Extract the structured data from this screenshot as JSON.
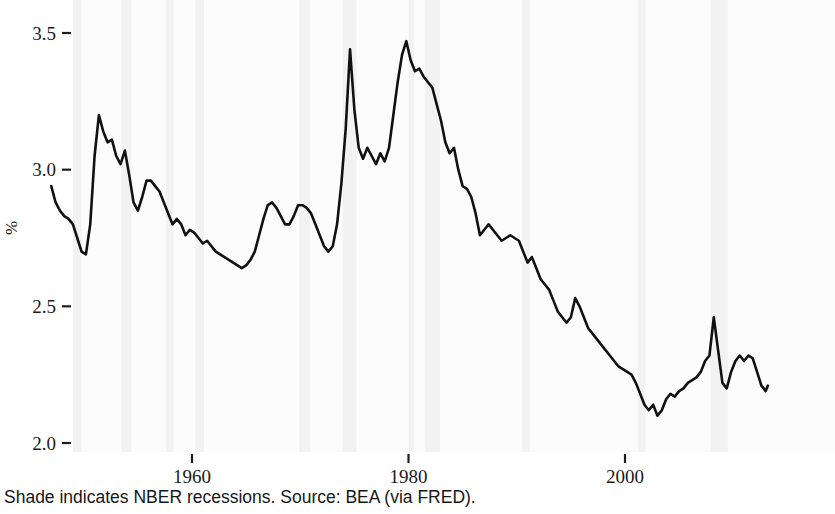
{
  "figure": {
    "caption": "Shade indicates NBER recessions. Source: BEA (via FRED).",
    "background_color": "#ffffff",
    "panel_color": "#fcfcfc",
    "line_color": "#111111",
    "shade_color": "#f2f2f2"
  },
  "axes": {
    "y_title": "%",
    "y_ticks": [
      "2.0",
      "2.5",
      "3.0",
      "3.5"
    ],
    "x_ticks": [
      "1960",
      "1980",
      "2000"
    ]
  },
  "chart_data": {
    "type": "line",
    "title": "",
    "subtitle": "",
    "xlabel": "",
    "ylabel": "%",
    "caption": "Shade indicates NBER recessions. Source: BEA (via FRED).",
    "legend": [],
    "legend_position": "none",
    "grid": false,
    "xlim": [
      1947.0,
      2013.2
    ],
    "ylim": [
      1.96,
      3.56
    ],
    "x_tick_values": [
      1960,
      1980,
      2000
    ],
    "y_tick_values": [
      2.0,
      2.5,
      3.0,
      3.5
    ],
    "x_tick_labels": [
      "1960",
      "1980",
      "2000"
    ],
    "y_tick_labels": [
      "2.0",
      "2.5",
      "3.0",
      "3.5"
    ],
    "series": [
      {
        "name": "Ratio",
        "color": "#111111",
        "x": [
          1947.0,
          1947.4,
          1947.8,
          1948.2,
          1948.6,
          1949.0,
          1949.4,
          1949.8,
          1950.2,
          1950.6,
          1951.0,
          1951.4,
          1951.8,
          1952.2,
          1952.6,
          1953.0,
          1953.4,
          1953.8,
          1954.2,
          1954.6,
          1955.0,
          1955.4,
          1955.8,
          1956.2,
          1956.6,
          1957.0,
          1957.4,
          1957.8,
          1958.2,
          1958.6,
          1959.0,
          1959.4,
          1959.8,
          1960.2,
          1960.6,
          1961.0,
          1961.4,
          1961.8,
          1962.2,
          1962.6,
          1963.0,
          1963.4,
          1963.8,
          1964.2,
          1964.6,
          1965.0,
          1965.4,
          1965.8,
          1966.2,
          1966.6,
          1967.0,
          1967.4,
          1967.8,
          1968.2,
          1968.6,
          1969.0,
          1969.4,
          1969.8,
          1970.2,
          1970.6,
          1971.0,
          1971.4,
          1971.8,
          1972.2,
          1972.6,
          1973.0,
          1973.4,
          1973.8,
          1974.2,
          1974.6,
          1975.0,
          1975.4,
          1975.8,
          1976.2,
          1976.6,
          1977.0,
          1977.4,
          1977.8,
          1978.2,
          1978.6,
          1979.0,
          1979.4,
          1979.8,
          1980.2,
          1980.6,
          1981.0,
          1981.4,
          1981.8,
          1982.2,
          1982.6,
          1983.0,
          1983.4,
          1983.8,
          1984.2,
          1984.6,
          1985.0,
          1985.4,
          1985.8,
          1986.2,
          1986.6,
          1987.0,
          1987.4,
          1987.8,
          1988.2,
          1988.6,
          1989.0,
          1989.4,
          1989.8,
          1990.2,
          1990.6,
          1991.0,
          1991.4,
          1991.8,
          1992.2,
          1992.6,
          1993.0,
          1993.4,
          1993.8,
          1994.2,
          1994.6,
          1995.0,
          1995.4,
          1995.8,
          1996.2,
          1996.6,
          1997.0,
          1997.4,
          1997.8,
          1998.2,
          1998.6,
          1999.0,
          1999.4,
          1999.8,
          2000.2,
          2000.6,
          2001.0,
          2001.4,
          2001.8,
          2002.2,
          2002.6,
          2003.0,
          2003.4,
          2003.8,
          2004.2,
          2004.6,
          2005.0,
          2005.4,
          2005.8,
          2006.2,
          2006.6,
          2007.0,
          2007.4,
          2007.8,
          2008.2,
          2008.6,
          2009.0,
          2009.4,
          2009.8,
          2010.2,
          2010.6,
          2011.0,
          2011.4,
          2011.8,
          2012.2,
          2012.6,
          2013.0,
          2013.2
        ],
        "y": [
          2.94,
          2.88,
          2.85,
          2.83,
          2.82,
          2.8,
          2.75,
          2.7,
          2.69,
          2.8,
          3.05,
          3.2,
          3.14,
          3.1,
          3.11,
          3.05,
          3.02,
          3.07,
          2.98,
          2.88,
          2.85,
          2.9,
          2.96,
          2.96,
          2.94,
          2.92,
          2.88,
          2.84,
          2.8,
          2.82,
          2.8,
          2.76,
          2.78,
          2.77,
          2.75,
          2.73,
          2.74,
          2.72,
          2.7,
          2.69,
          2.68,
          2.67,
          2.66,
          2.65,
          2.64,
          2.65,
          2.67,
          2.7,
          2.76,
          2.82,
          2.87,
          2.88,
          2.86,
          2.83,
          2.8,
          2.8,
          2.83,
          2.87,
          2.87,
          2.86,
          2.84,
          2.8,
          2.76,
          2.72,
          2.7,
          2.72,
          2.8,
          2.95,
          3.15,
          3.44,
          3.22,
          3.08,
          3.04,
          3.08,
          3.05,
          3.02,
          3.06,
          3.03,
          3.08,
          3.2,
          3.32,
          3.42,
          3.47,
          3.4,
          3.36,
          3.37,
          3.34,
          3.32,
          3.3,
          3.24,
          3.18,
          3.1,
          3.06,
          3.08,
          3.0,
          2.94,
          2.93,
          2.9,
          2.84,
          2.76,
          2.78,
          2.8,
          2.78,
          2.76,
          2.74,
          2.75,
          2.76,
          2.75,
          2.74,
          2.7,
          2.66,
          2.68,
          2.64,
          2.6,
          2.58,
          2.56,
          2.52,
          2.48,
          2.46,
          2.44,
          2.46,
          2.53,
          2.5,
          2.46,
          2.42,
          2.4,
          2.38,
          2.36,
          2.34,
          2.32,
          2.3,
          2.28,
          2.27,
          2.26,
          2.25,
          2.22,
          2.18,
          2.14,
          2.12,
          2.14,
          2.1,
          2.12,
          2.16,
          2.18,
          2.17,
          2.19,
          2.2,
          2.22,
          2.23,
          2.24,
          2.26,
          2.3,
          2.32,
          2.46,
          2.34,
          2.22,
          2.2,
          2.26,
          2.3,
          2.32,
          2.3,
          2.32,
          2.31,
          2.26,
          2.21,
          2.19,
          2.21
        ]
      }
    ],
    "shaded_regions": [
      {
        "label": "NBER recession",
        "start": 1948.9,
        "end": 1949.8
      },
      {
        "label": "NBER recession",
        "start": 1953.5,
        "end": 1954.4
      },
      {
        "label": "NBER recession",
        "start": 1957.6,
        "end": 1958.3
      },
      {
        "label": "NBER recession",
        "start": 1960.3,
        "end": 1961.1
      },
      {
        "label": "NBER recession",
        "start": 1969.9,
        "end": 1970.9
      },
      {
        "label": "NBER recession",
        "start": 1973.9,
        "end": 1975.2
      },
      {
        "label": "NBER recession",
        "start": 1980.0,
        "end": 1980.5
      },
      {
        "label": "NBER recession",
        "start": 1981.5,
        "end": 1982.9
      },
      {
        "label": "NBER recession",
        "start": 1990.5,
        "end": 1991.2
      },
      {
        "label": "NBER recession",
        "start": 2001.2,
        "end": 2001.9
      },
      {
        "label": "NBER recession",
        "start": 2007.9,
        "end": 2009.5
      }
    ]
  }
}
